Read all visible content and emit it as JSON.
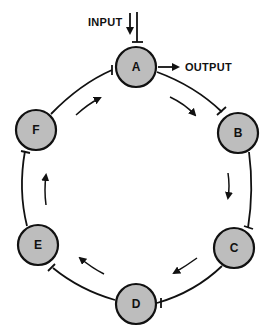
{
  "diagram": {
    "type": "cyclic inhibitory network",
    "nodes": [
      {
        "id": "A",
        "label": "A",
        "cx": 136,
        "cy": 67
      },
      {
        "id": "B",
        "label": "B",
        "cx": 238,
        "cy": 133
      },
      {
        "id": "C",
        "label": "C",
        "cx": 234,
        "cy": 248
      },
      {
        "id": "D",
        "label": "D",
        "cx": 136,
        "cy": 304
      },
      {
        "id": "E",
        "label": "E",
        "cx": 38,
        "cy": 245
      },
      {
        "id": "F",
        "label": "F",
        "cx": 36,
        "cy": 130
      }
    ],
    "edges": [
      {
        "from": "A",
        "to": "B",
        "type": "inhibitory"
      },
      {
        "from": "B",
        "to": "C",
        "type": "inhibitory"
      },
      {
        "from": "C",
        "to": "D",
        "type": "inhibitory"
      },
      {
        "from": "D",
        "to": "E",
        "type": "inhibitory"
      },
      {
        "from": "E",
        "to": "F",
        "type": "inhibitory"
      },
      {
        "from": "F",
        "to": "A",
        "type": "inhibitory"
      }
    ],
    "input_label": "INPUT",
    "output_label": "OUTPUT",
    "flow_direction": "clockwise",
    "colors": {
      "node_fill": "#bdbdbd",
      "stroke": "#111111",
      "background": "#ffffff"
    }
  }
}
